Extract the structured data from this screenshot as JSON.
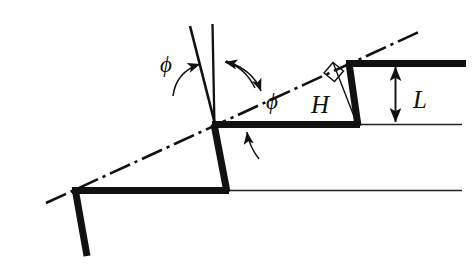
{
  "figure": {
    "background_color": "#ffffff",
    "ink_color": "#111111",
    "width": 472,
    "height": 274
  },
  "labels": {
    "phi_upper": "ϕ",
    "phi_lower": "ϕ",
    "height_H": "H",
    "length_L": "L"
  },
  "annotations": {
    "right_angle_marker": "right-angle-square",
    "upper_angle_name": "phi-angle-upper",
    "lower_angle_name": "phi-angle-lower",
    "dimension_L_name": "dimension-arrow-L",
    "dimension_H_name": "dimension-leader-H"
  },
  "geometry": {
    "centerline_style": "dash-dot",
    "centerline_angle_deg": 14,
    "step_count": 2,
    "thick_stroke_width": 7,
    "thin_stroke_width": 1.4
  },
  "colors": {
    "stroke": "#111111",
    "thin_stroke": "#222222",
    "fill": "none"
  }
}
